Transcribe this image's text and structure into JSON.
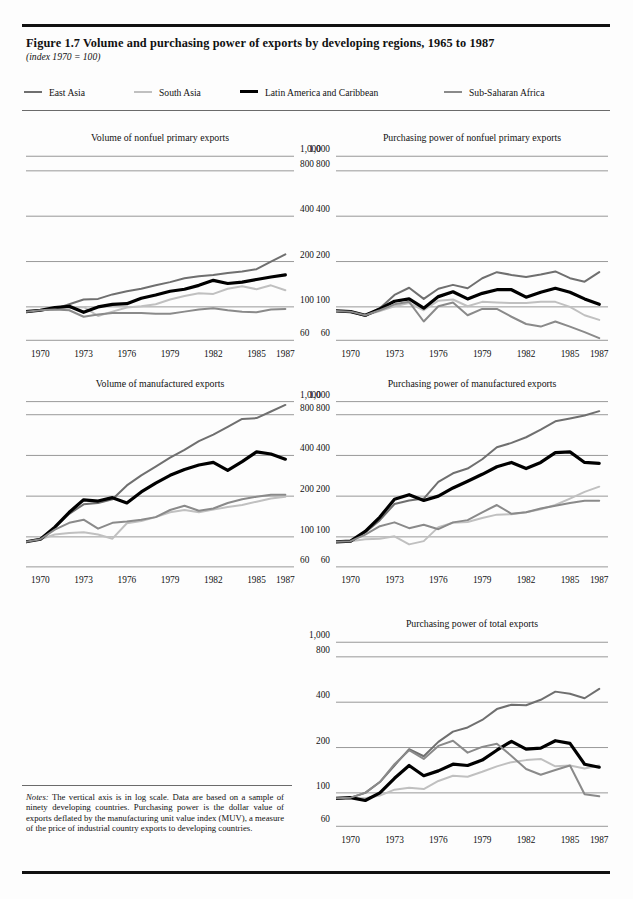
{
  "figure": {
    "title": "Figure 1.7  Volume and purchasing power of exports by developing regions, 1965 to 1987",
    "subtitle": "(index 1970 = 100)",
    "notes_label": "Notes:",
    "notes": " The vertical axis is in log scale. Data are based on a sample of ninety developing countries. Purchasing power is the dollar value of exports deflated by the manufacturing unit value index (MUV), a measure of the price of industrial country exports to developing countries."
  },
  "legend": {
    "items": [
      {
        "label": "East Asia",
        "color": "#6f6f6f",
        "width": 2.0
      },
      {
        "label": "South Asia",
        "color": "#c0c0c0",
        "width": 2.0
      },
      {
        "label": "Latin America and Caribbean",
        "color": "#000000",
        "width": 3.2
      },
      {
        "label": "Sub-Saharan Africa",
        "color": "#8a8a8a",
        "width": 2.0
      }
    ]
  },
  "axis": {
    "y_ticks": [
      "1,000",
      "800",
      "400",
      "200",
      "100",
      "60"
    ],
    "y_values": [
      1000,
      800,
      400,
      200,
      100,
      60
    ],
    "y_min": 55,
    "y_max": 1100,
    "x_ticks": [
      "1970",
      "1973",
      "1976",
      "1979",
      "1982",
      "1985",
      "1987"
    ],
    "x_values": [
      1970,
      1973,
      1976,
      1979,
      1982,
      1985,
      1987
    ],
    "x_min": 1969,
    "x_max": 1987.6
  },
  "chart_data": [
    {
      "id": "volume-nonfuel",
      "type": "line",
      "title": "Volume of nonfuel primary exports",
      "xlabel": "",
      "ylabel": "",
      "ylim": [
        55,
        1100
      ],
      "yscale": "log",
      "grid": true,
      "x": [
        1969,
        1970,
        1971,
        1972,
        1973,
        1974,
        1975,
        1976,
        1977,
        1978,
        1979,
        1980,
        1981,
        1982,
        1983,
        1984,
        1985,
        1986,
        1987
      ],
      "series": [
        {
          "name": "East Asia",
          "color": "#6f6f6f",
          "width": 2.0,
          "values": [
            93,
            95,
            97,
            104,
            112,
            113,
            121,
            127,
            132,
            139,
            146,
            155,
            160,
            163,
            168,
            172,
            178,
            200,
            223
          ]
        },
        {
          "name": "South Asia",
          "color": "#c0c0c0",
          "width": 2.0,
          "values": [
            93,
            95,
            96,
            98,
            100,
            87,
            93,
            99,
            101,
            104,
            112,
            118,
            123,
            122,
            132,
            137,
            131,
            139,
            129
          ]
        },
        {
          "name": "Latin America and Caribbean",
          "color": "#000000",
          "width": 3.2,
          "values": [
            93,
            95,
            99,
            101,
            92,
            100,
            104,
            105,
            114,
            120,
            127,
            131,
            139,
            150,
            143,
            146,
            152,
            158,
            163
          ]
        },
        {
          "name": "Sub-Saharan Africa",
          "color": "#8a8a8a",
          "width": 2.0,
          "values": [
            93,
            95,
            96,
            95,
            86,
            89,
            91,
            91,
            91,
            90,
            90,
            93,
            96,
            98,
            95,
            93,
            92,
            96,
            97
          ]
        }
      ]
    },
    {
      "id": "power-nonfuel",
      "type": "line",
      "title": "Purchasing power of nonfuel primary exports",
      "xlabel": "",
      "ylabel": "",
      "ylim": [
        55,
        1100
      ],
      "yscale": "log",
      "grid": true,
      "x": [
        1969,
        1970,
        1971,
        1972,
        1973,
        1974,
        1975,
        1976,
        1977,
        1978,
        1979,
        1980,
        1981,
        1982,
        1983,
        1984,
        1985,
        1986,
        1987
      ],
      "series": [
        {
          "name": "East Asia",
          "color": "#6f6f6f",
          "width": 2.0,
          "values": [
            94,
            93,
            87,
            98,
            120,
            134,
            113,
            132,
            140,
            133,
            155,
            170,
            163,
            158,
            164,
            172,
            155,
            147,
            170
          ]
        },
        {
          "name": "South Asia",
          "color": "#c0c0c0",
          "width": 2.0,
          "values": [
            94,
            93,
            88,
            94,
            101,
            106,
            95,
            110,
            112,
            101,
            108,
            107,
            106,
            106,
            108,
            108,
            100,
            88,
            82
          ]
        },
        {
          "name": "Latin America and Caribbean",
          "color": "#000000",
          "width": 3.2,
          "values": [
            94,
            93,
            88,
            97,
            109,
            113,
            98,
            117,
            126,
            113,
            123,
            130,
            130,
            116,
            125,
            133,
            125,
            113,
            104
          ]
        },
        {
          "name": "Sub-Saharan Africa",
          "color": "#8a8a8a",
          "width": 2.0,
          "values": [
            94,
            93,
            88,
            95,
            104,
            108,
            80,
            101,
            107,
            88,
            97,
            97,
            86,
            77,
            74,
            80,
            74,
            68,
            62
          ]
        }
      ]
    },
    {
      "id": "volume-manufactured",
      "type": "line",
      "title": "Volume of manufactured exports",
      "xlabel": "",
      "ylabel": "",
      "ylim": [
        55,
        1100
      ],
      "yscale": "log",
      "grid": true,
      "x": [
        1969,
        1970,
        1971,
        1972,
        1973,
        1974,
        1975,
        1976,
        1977,
        1978,
        1979,
        1980,
        1981,
        1982,
        1983,
        1984,
        1985,
        1986,
        1987
      ],
      "series": [
        {
          "name": "East Asia",
          "color": "#6f6f6f",
          "width": 2.0,
          "values": [
            92,
            96,
            117,
            148,
            174,
            178,
            190,
            240,
            285,
            330,
            385,
            440,
            510,
            570,
            650,
            745,
            755,
            845,
            945
          ]
        },
        {
          "name": "South Asia",
          "color": "#c0c0c0",
          "width": 2.0,
          "values": [
            92,
            96,
            104,
            107,
            108,
            104,
            97,
            126,
            131,
            140,
            152,
            158,
            152,
            159,
            166,
            172,
            182,
            192,
            198
          ]
        },
        {
          "name": "Latin America and Caribbean",
          "color": "#000000",
          "width": 3.2,
          "values": [
            92,
            96,
            118,
            152,
            188,
            184,
            195,
            178,
            215,
            250,
            285,
            315,
            340,
            355,
            310,
            360,
            425,
            410,
            375
          ]
        },
        {
          "name": "Sub-Saharan Africa",
          "color": "#8a8a8a",
          "width": 2.0,
          "values": [
            92,
            96,
            113,
            127,
            134,
            115,
            127,
            130,
            134,
            140,
            158,
            170,
            156,
            162,
            178,
            190,
            198,
            205,
            205
          ]
        }
      ]
    },
    {
      "id": "power-manufactured",
      "type": "line",
      "title": "Purchasing power of manufactured exports",
      "xlabel": "",
      "ylabel": "",
      "ylim": [
        55,
        1100
      ],
      "yscale": "log",
      "grid": true,
      "x": [
        1969,
        1970,
        1971,
        1972,
        1973,
        1974,
        1975,
        1976,
        1977,
        1978,
        1979,
        1980,
        1981,
        1982,
        1983,
        1984,
        1985,
        1986,
        1987
      ],
      "series": [
        {
          "name": "East Asia",
          "color": "#6f6f6f",
          "width": 2.0,
          "values": [
            92,
            93,
            108,
            133,
            175,
            186,
            192,
            255,
            295,
            320,
            375,
            460,
            495,
            545,
            620,
            715,
            750,
            790,
            850
          ]
        },
        {
          "name": "South Asia",
          "color": "#c0c0c0",
          "width": 2.0,
          "values": [
            92,
            93,
            96,
            97,
            101,
            88,
            93,
            118,
            127,
            129,
            138,
            146,
            147,
            152,
            160,
            172,
            192,
            215,
            235
          ]
        },
        {
          "name": "Latin America and Caribbean",
          "color": "#000000",
          "width": 3.2,
          "values": [
            92,
            93,
            110,
            140,
            190,
            205,
            186,
            200,
            230,
            258,
            290,
            330,
            355,
            320,
            355,
            420,
            425,
            355,
            350
          ]
        },
        {
          "name": "Sub-Saharan Africa",
          "color": "#8a8a8a",
          "width": 2.0,
          "values": [
            92,
            93,
            104,
            120,
            128,
            116,
            123,
            114,
            128,
            133,
            152,
            172,
            148,
            152,
            162,
            170,
            178,
            185,
            185
          ]
        }
      ]
    },
    {
      "id": "power-total",
      "type": "line",
      "title": "Purchasing power of total exports",
      "xlabel": "",
      "ylabel": "",
      "ylim": [
        55,
        1100
      ],
      "yscale": "log",
      "grid": true,
      "x": [
        1969,
        1970,
        1971,
        1972,
        1973,
        1974,
        1975,
        1976,
        1977,
        1978,
        1979,
        1980,
        1981,
        1982,
        1983,
        1984,
        1985,
        1986,
        1987
      ],
      "series": [
        {
          "name": "East Asia",
          "color": "#6f6f6f",
          "width": 2.0,
          "values": [
            92,
            93,
            100,
            118,
            152,
            195,
            175,
            218,
            255,
            272,
            305,
            360,
            385,
            382,
            415,
            470,
            455,
            425,
            490
          ]
        },
        {
          "name": "South Asia",
          "color": "#c0c0c0",
          "width": 2.0,
          "values": [
            92,
            93,
            92,
            96,
            105,
            108,
            106,
            120,
            130,
            128,
            138,
            150,
            160,
            165,
            168,
            150,
            152,
            145,
            152
          ]
        },
        {
          "name": "Latin America and Caribbean",
          "color": "#000000",
          "width": 3.2,
          "values": [
            92,
            93,
            89,
            100,
            125,
            152,
            130,
            140,
            155,
            152,
            165,
            192,
            220,
            195,
            198,
            222,
            213,
            155,
            148
          ]
        },
        {
          "name": "Sub-Saharan Africa",
          "color": "#8a8a8a",
          "width": 2.0,
          "values": [
            92,
            93,
            100,
            118,
            155,
            192,
            168,
            205,
            222,
            185,
            202,
            212,
            176,
            144,
            132,
            142,
            152,
            98,
            95
          ]
        }
      ]
    }
  ],
  "layout": {
    "panels": [
      {
        "id": "volume-nonfuel",
        "left": 26,
        "top": 132,
        "width": 268,
        "plot_top": 150,
        "plot_height": 196,
        "xaxis_top": 347
      },
      {
        "id": "power-nonfuel",
        "left": 336,
        "top": 132,
        "width": 272,
        "plot_top": 150,
        "plot_height": 196,
        "xaxis_top": 347
      },
      {
        "id": "volume-manufactured",
        "left": 26,
        "top": 378,
        "width": 268,
        "plot_top": 396,
        "plot_height": 176,
        "xaxis_top": 573
      },
      {
        "id": "power-manufactured",
        "left": 336,
        "top": 378,
        "width": 272,
        "plot_top": 396,
        "plot_height": 176,
        "xaxis_top": 573
      },
      {
        "id": "power-total",
        "left": 336,
        "top": 618,
        "width": 272,
        "plot_top": 636,
        "plot_height": 196,
        "xaxis_top": 833
      }
    ],
    "ylabel_side": {
      "volume-nonfuel": "right",
      "power-nonfuel": "left",
      "volume-manufactured": "right",
      "power-manufactured": "left",
      "power-total": "left"
    }
  }
}
